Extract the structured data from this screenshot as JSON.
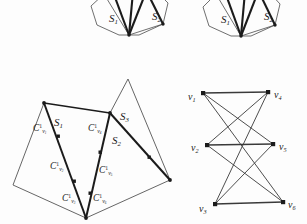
{
  "figure": {
    "background_color": "#fdfdfd",
    "ink_color": "#1b1b1b",
    "thin_line_color": "#4a4a4a"
  },
  "subfigures": {
    "top_left": {
      "name": "partial-fan-top-left",
      "labels": [
        {
          "base": "S",
          "sub": "1",
          "x": 109,
          "y": 13
        },
        {
          "base": "S",
          "sub": "2",
          "x": 152,
          "y": 11
        }
      ]
    },
    "top_right": {
      "name": "partial-fan-top-right",
      "labels": [
        {
          "base": "S",
          "sub": "1",
          "x": 221,
          "y": 14
        },
        {
          "base": "S",
          "sub": "2",
          "x": 264,
          "y": 11
        }
      ]
    },
    "polygon": {
      "name": "polygon-with-guard-chains",
      "region_labels": [
        {
          "base": "S",
          "sub": "1",
          "x": 54,
          "y": 117
        },
        {
          "base": "S",
          "sub": "2",
          "x": 112,
          "y": 135
        },
        {
          "base": "S",
          "sub": "3",
          "x": 120,
          "y": 111
        }
      ],
      "chain_labels": [
        {
          "base": "C",
          "sup": "1",
          "sub": "v",
          "sub2": "1",
          "x": 33,
          "y": 124
        },
        {
          "base": "C",
          "sup": "1",
          "sub": "v",
          "sub2": "2",
          "x": 50,
          "y": 162
        },
        {
          "base": "C",
          "sup": "1",
          "sub": "v",
          "sub2": "3",
          "x": 62,
          "y": 194
        },
        {
          "base": "C",
          "sup": "1",
          "sub": "v",
          "sub2": "4",
          "x": 88,
          "y": 124
        },
        {
          "base": "C",
          "sup": "1",
          "sub": "v",
          "sub2": "5",
          "x": 99,
          "y": 166
        },
        {
          "base": "C",
          "sup": "1",
          "sub": "v",
          "sub2": "6",
          "x": 93,
          "y": 194
        }
      ]
    },
    "graph": {
      "name": "complete-bipartite-graph-k33",
      "vertex_labels": [
        {
          "base": "v",
          "sub": "1",
          "x": 188,
          "y": 92
        },
        {
          "base": "v",
          "sub": "2",
          "x": 191,
          "y": 143
        },
        {
          "base": "v",
          "sub": "3",
          "x": 199,
          "y": 204
        },
        {
          "base": "v",
          "sub": "4",
          "x": 274,
          "y": 90
        },
        {
          "base": "v",
          "sub": "5",
          "x": 279,
          "y": 142
        },
        {
          "base": "v",
          "sub": "6",
          "x": 288,
          "y": 200
        }
      ],
      "nodes": {
        "left": [
          {
            "id": "v1",
            "cx": 203,
            "cy": 93
          },
          {
            "id": "v2",
            "cx": 207,
            "cy": 145
          },
          {
            "id": "v3",
            "cx": 215,
            "cy": 204
          }
        ],
        "right": [
          {
            "id": "v4",
            "cx": 268,
            "cy": 92
          },
          {
            "id": "v5",
            "cx": 273,
            "cy": 144
          },
          {
            "id": "v6",
            "cx": 283,
            "cy": 202
          }
        ]
      },
      "edges": [
        [
          "v1",
          "v4"
        ],
        [
          "v1",
          "v5"
        ],
        [
          "v1",
          "v6"
        ],
        [
          "v2",
          "v4"
        ],
        [
          "v2",
          "v5"
        ],
        [
          "v2",
          "v6"
        ],
        [
          "v3",
          "v4"
        ],
        [
          "v3",
          "v5"
        ],
        [
          "v3",
          "v6"
        ]
      ]
    }
  }
}
